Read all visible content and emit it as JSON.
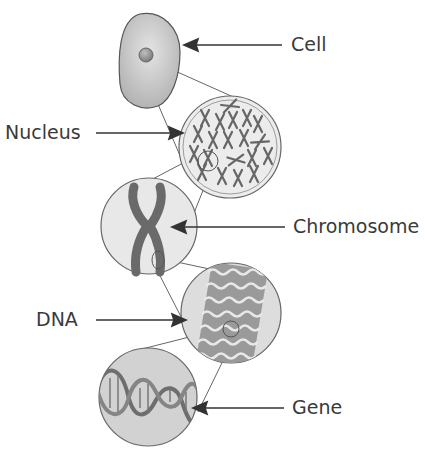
{
  "labels": {
    "cell": "Cell",
    "nucleus": "Nucleus",
    "chromosome": "Chromosome",
    "dna": "DNA",
    "gene": "Gene"
  },
  "colors": {
    "stroke": "#555555",
    "cell_fill": "#c8c8c8",
    "circle_fill": "#e6e6e6",
    "chromosome": "#6a6a6a",
    "text": "#3a3a3a"
  }
}
